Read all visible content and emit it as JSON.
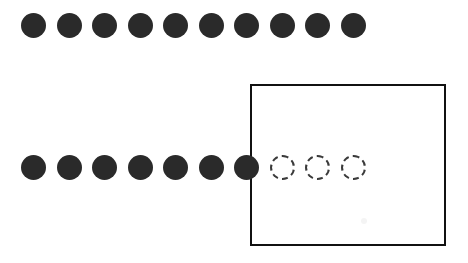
{
  "figure": {
    "background_color": "#ffffff",
    "width": 468,
    "height": 263
  },
  "colors": {
    "dot_fill": "#2a2a2a",
    "dot_outline": "#3a3a3a",
    "box_border": "#111111",
    "background": "#ffffff"
  },
  "layout": {
    "dot_diameter": 25,
    "dot_spacing": 35.5,
    "row_start_x": 21,
    "row1_center_y": 25,
    "row2_center_y": 167
  },
  "region": {
    "name": "grouping-rectangle",
    "x": 250,
    "y": 84,
    "width": 196,
    "height": 162,
    "border_width": 2,
    "border_color": "#111111",
    "border_style": "solid"
  },
  "rows": [
    {
      "name": "top-row",
      "center_y": 25,
      "total_count": 10,
      "filled_count": 10,
      "dashed_count": 0,
      "dots": [
        {
          "index": 1,
          "style": "filled",
          "cx": 33.5,
          "cy": 25
        },
        {
          "index": 2,
          "style": "filled",
          "cx": 69.0,
          "cy": 25
        },
        {
          "index": 3,
          "style": "filled",
          "cx": 104.5,
          "cy": 25
        },
        {
          "index": 4,
          "style": "filled",
          "cx": 140.0,
          "cy": 25
        },
        {
          "index": 5,
          "style": "filled",
          "cx": 175.5,
          "cy": 25
        },
        {
          "index": 6,
          "style": "filled",
          "cx": 211.0,
          "cy": 25
        },
        {
          "index": 7,
          "style": "filled",
          "cx": 246.5,
          "cy": 25
        },
        {
          "index": 8,
          "style": "filled",
          "cx": 282.0,
          "cy": 25
        },
        {
          "index": 9,
          "style": "filled",
          "cx": 317.5,
          "cy": 25
        },
        {
          "index": 10,
          "style": "filled",
          "cx": 353.0,
          "cy": 25
        }
      ]
    },
    {
      "name": "bottom-row",
      "center_y": 167,
      "total_count": 10,
      "filled_count": 7,
      "dashed_count": 3,
      "dots": [
        {
          "index": 1,
          "style": "filled",
          "cx": 33.5,
          "cy": 167
        },
        {
          "index": 2,
          "style": "filled",
          "cx": 69.0,
          "cy": 167
        },
        {
          "index": 3,
          "style": "filled",
          "cx": 104.5,
          "cy": 167
        },
        {
          "index": 4,
          "style": "filled",
          "cx": 140.0,
          "cy": 167
        },
        {
          "index": 5,
          "style": "filled",
          "cx": 175.5,
          "cy": 167
        },
        {
          "index": 6,
          "style": "filled",
          "cx": 211.0,
          "cy": 167
        },
        {
          "index": 7,
          "style": "filled",
          "cx": 246.5,
          "cy": 167
        },
        {
          "index": 8,
          "style": "dashed",
          "cx": 282.0,
          "cy": 167
        },
        {
          "index": 9,
          "style": "dashed",
          "cx": 317.5,
          "cy": 167
        },
        {
          "index": 10,
          "style": "dashed",
          "cx": 353.0,
          "cy": 167
        }
      ]
    }
  ],
  "artifacts": [
    {
      "name": "scan-smudge",
      "cx": 364,
      "cy": 221,
      "r": 3
    }
  ]
}
